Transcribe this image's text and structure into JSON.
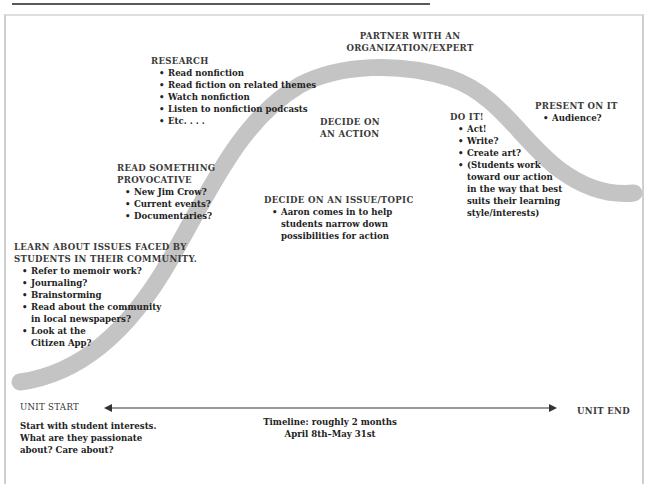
{
  "title_rule": true,
  "colors": {
    "curve": "#c4c4c4",
    "text": "#2a2a2a",
    "arrow": "#333333",
    "frame": "#cfcfcf"
  },
  "stages": {
    "learn": {
      "heading_line1": "LEARN ABOUT ISSUES FACED BY",
      "heading_line2": "STUDENTS IN THEIR COMMUNITY.",
      "items": [
        "Refer to memoir work?",
        "Journaling?",
        "Brainstorming",
        "Read about the community",
        "in local newspapers?",
        "Look at the",
        "Citizen App?"
      ]
    },
    "provocative": {
      "heading_line1": "READ SOMETHING",
      "heading_line2": "PROVOCATIVE",
      "items": [
        "New Jim Crow?",
        "Current events?",
        "Documentaries?"
      ]
    },
    "research": {
      "heading": "RESEARCH",
      "items": [
        "Read nonfiction",
        "Read fiction on related themes",
        "Watch nonfiction",
        "Listen to nonfiction podcasts",
        "Etc. . . ."
      ]
    },
    "partner": {
      "heading_line1": "PARTNER WITH AN",
      "heading_line2": "ORGANIZATION/EXPERT"
    },
    "decide_action": {
      "heading_line1": "DECIDE ON",
      "heading_line2": "AN ACTION"
    },
    "decide_issue": {
      "heading": "DECIDE ON AN ISSUE/TOPIC",
      "items": [
        "Aaron comes in to help",
        "students narrow down",
        "possibilities for action"
      ]
    },
    "do_it": {
      "heading": "DO IT!",
      "items": [
        "Act!",
        "Write?",
        "Create art?",
        "(Students work",
        "toward our action",
        "in the way that best",
        "suits their learning",
        "style/interests)"
      ]
    },
    "present": {
      "heading": "PRESENT ON IT",
      "items": [
        "Audience?"
      ]
    }
  },
  "timeline": {
    "start_label": "UNIT START",
    "end_label": "UNIT END",
    "start_note": [
      "Start with student interests.",
      "What are they passionate",
      "about? Care about?"
    ],
    "duration_line1": "Timeline: roughly 2 months",
    "duration_line2": "April 8th–May 31st"
  }
}
